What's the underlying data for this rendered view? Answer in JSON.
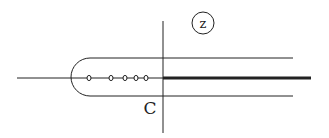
{
  "diagram": {
    "title": "",
    "plane_label": "z",
    "contour_label": "C",
    "colors": {
      "line": "#222222",
      "background": "#ffffff"
    },
    "real_axis": {
      "x1": 17,
      "x2": 163,
      "y": 78
    },
    "imag_axis": {
      "x": 163,
      "y1": 21,
      "y2": 133
    },
    "branch_cut": {
      "x1": 163,
      "x2": 311,
      "y": 78,
      "width": 3
    },
    "contour": {
      "top_y": 58,
      "bottom_y": 96,
      "left_arc_center_x": 90,
      "right_end_x": 293
    },
    "poles_x": [
      89,
      111,
      125,
      136,
      146
    ],
    "poles_y": 78
  }
}
